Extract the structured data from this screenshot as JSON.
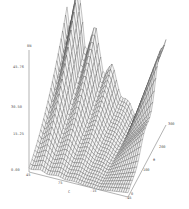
{
  "chart_data": {
    "type": "surface3d",
    "title": "",
    "zlabel": "δN",
    "xlabel": "C",
    "ylabel": "θ",
    "z_ticks": [
      "0.00",
      "15.25",
      "30.50",
      "45.76"
    ],
    "x_ticks": [
      "45",
      "75",
      "-15",
      "-45"
    ],
    "y_ticks": [
      "0",
      "100",
      "200",
      "300"
    ],
    "zlim": [
      0,
      45.76
    ],
    "ylim": [
      0,
      300
    ],
    "grid": false,
    "style": "wireframe mesh, black lines on white",
    "ridges": [
      {
        "name": "ridge-1 (tallest, back)",
        "peak_z": 45.76
      },
      {
        "name": "ridge-2",
        "peak_z": 38
      },
      {
        "name": "ridge-3",
        "peak_z": 30
      },
      {
        "name": "ridge-4 (front)",
        "peak_z": 22
      },
      {
        "name": "right-fold peak",
        "peak_z": 33
      }
    ]
  }
}
